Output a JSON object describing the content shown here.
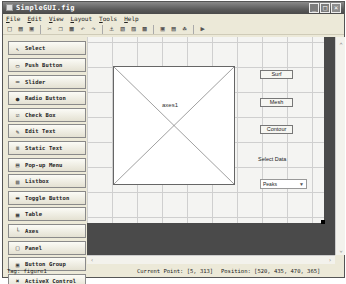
{
  "window": {
    "title": "SimpleGUI.fig",
    "controls": [
      "minimize",
      "maximize",
      "close"
    ]
  },
  "menu": [
    "File",
    "Edit",
    "View",
    "Layout",
    "Tools",
    "Help"
  ],
  "toolbar": [
    {
      "icon": "new-icon",
      "glyph": "□"
    },
    {
      "icon": "open-icon",
      "glyph": "▤"
    },
    {
      "icon": "save-icon",
      "glyph": "▣"
    },
    {
      "sep": true
    },
    {
      "icon": "cut-icon",
      "glyph": "✂"
    },
    {
      "icon": "copy-icon",
      "glyph": "❐"
    },
    {
      "icon": "paste-icon",
      "glyph": "▦"
    },
    {
      "icon": "undo-icon",
      "glyph": "↶"
    },
    {
      "icon": "redo-icon",
      "glyph": "↷"
    },
    {
      "sep": true
    },
    {
      "icon": "align-icon",
      "glyph": "⚓"
    },
    {
      "icon": "menu-editor-icon",
      "glyph": "▧"
    },
    {
      "icon": "tab-order-icon",
      "glyph": "▨"
    },
    {
      "icon": "toolbar-editor-icon",
      "glyph": "▩"
    },
    {
      "sep": true
    },
    {
      "icon": "editor-icon",
      "glyph": "▣"
    },
    {
      "icon": "property-inspector-icon",
      "glyph": "▤"
    },
    {
      "icon": "object-browser-icon",
      "glyph": "☘"
    },
    {
      "sep": true
    },
    {
      "icon": "run-icon",
      "glyph": "▶"
    }
  ],
  "palette": [
    {
      "label": "Select",
      "icon": "cursor-icon",
      "glyph": "↖"
    },
    {
      "label": "Push Button",
      "icon": "push-button-icon",
      "glyph": "▭"
    },
    {
      "label": "Slider",
      "icon": "slider-icon",
      "glyph": "═"
    },
    {
      "label": "Radio Button",
      "icon": "radio-button-icon",
      "glyph": "●"
    },
    {
      "label": "Check Box",
      "icon": "check-box-icon",
      "glyph": "☑"
    },
    {
      "label": "Edit Text",
      "icon": "edit-text-icon",
      "glyph": "✎"
    },
    {
      "label": "Static Text",
      "icon": "static-text-icon",
      "glyph": "≡"
    },
    {
      "label": "Pop-up Menu",
      "icon": "popup-menu-icon",
      "glyph": "▤"
    },
    {
      "label": "Listbox",
      "icon": "listbox-icon",
      "glyph": "▥"
    },
    {
      "label": "Toggle Button",
      "icon": "toggle-button-icon",
      "glyph": "▬"
    },
    {
      "label": "Table",
      "icon": "table-icon",
      "glyph": "▦"
    },
    {
      "label": "Axes",
      "icon": "axes-icon",
      "glyph": "└"
    },
    {
      "label": "Panel",
      "icon": "panel-icon",
      "glyph": "□"
    },
    {
      "label": "Button Group",
      "icon": "button-group-icon",
      "glyph": "▣"
    },
    {
      "label": "ActiveX Control",
      "icon": "activex-icon",
      "glyph": "✖"
    }
  ],
  "canvas": {
    "axes_label": "axes1",
    "buttons": [
      {
        "label": "Surf",
        "top": 33
      },
      {
        "label": "Mesh",
        "top": 61
      },
      {
        "label": "Contour",
        "top": 88
      }
    ],
    "select_label": "Select Data",
    "popup_value": "Peaks"
  },
  "status": {
    "tag": "Tag: figure1",
    "current_point": "Current Point:  [5, 313]",
    "position": "Position: [520, 435, 470, 365]"
  }
}
